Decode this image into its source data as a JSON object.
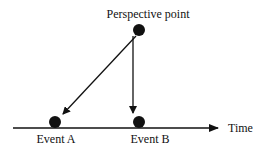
{
  "diagram": {
    "perspective_point": {
      "label": "Perspective point",
      "x": 139,
      "y": 30
    },
    "events": [
      {
        "label": "Event A",
        "x": 55,
        "y": 123
      },
      {
        "label": "Event B",
        "x": 139,
        "y": 123
      }
    ],
    "timeline": {
      "label": "Time",
      "y": 128,
      "x_start": 13,
      "x_end": 218
    },
    "colors": {
      "ink": "#111111",
      "background": "#ffffff"
    }
  }
}
